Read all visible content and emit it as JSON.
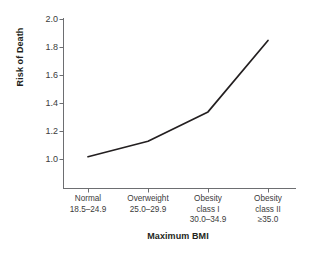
{
  "chart_data": {
    "type": "line",
    "title": "",
    "xlabel": "Maximum BMI",
    "ylabel": "Risk of Death",
    "categories": [
      "Normal 18.5–24.9",
      "Overweight 25.0–29.9",
      "Obesity class I 30.0–34.9",
      "Obesity class II ≥35.0"
    ],
    "values": [
      1.02,
      1.13,
      1.34,
      1.85
    ],
    "xlim": [
      0,
      5
    ],
    "ylim": [
      0.88,
      2.0
    ],
    "yticks": [
      1.0,
      1.2,
      1.4,
      1.6,
      1.8,
      2.0
    ],
    "grid": false,
    "legend": null,
    "line_color": "#231f20",
    "series": [
      {
        "name": "Risk of Death",
        "values": [
          1.02,
          1.13,
          1.34,
          1.85
        ]
      }
    ]
  },
  "axes": {
    "y_title": "Risk of Death",
    "x_title": "Maximum BMI",
    "y_tick_labels": [
      "2.0",
      "1.8",
      "1.6",
      "1.4",
      "1.2",
      "1.0"
    ],
    "x_tick_labels": [
      {
        "line1": "Normal",
        "line2": "18.5–24.9",
        "line3": ""
      },
      {
        "line1": "Overweight",
        "line2": "25.0–29.9",
        "line3": ""
      },
      {
        "line1": "Obesity",
        "line2": "class I",
        "line3": "30.0–34.9"
      },
      {
        "line1": "Obesity",
        "line2": "class II",
        "line3": "≥35.0"
      }
    ]
  },
  "colors": {
    "line": "#231f20",
    "axis": "#6d6e71",
    "text": "#231f20",
    "tick_text": "#3b3b3b",
    "background": "#ffffff"
  }
}
